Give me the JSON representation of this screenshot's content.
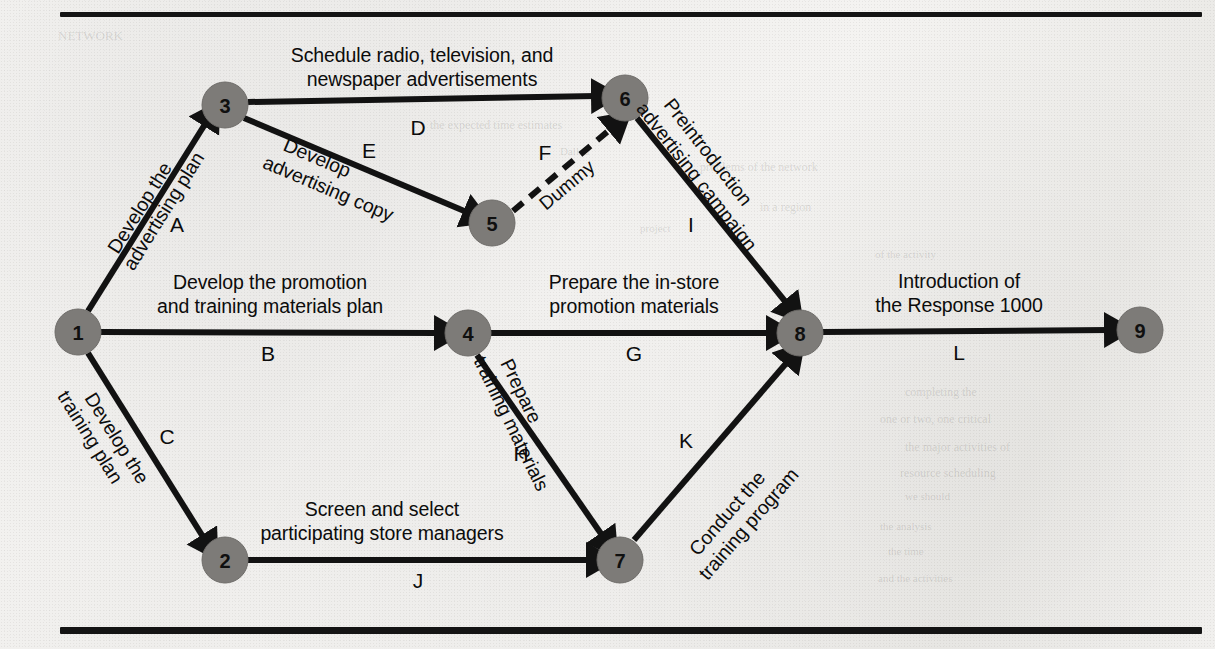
{
  "figure": {
    "type": "activity-on-arrow network diagram",
    "top_rule": true,
    "bottom_rule": true
  },
  "nodes": [
    {
      "id": "1",
      "label": "1",
      "cx": 78,
      "cy": 332,
      "r": 23
    },
    {
      "id": "2",
      "label": "2",
      "cx": 225,
      "cy": 560,
      "r": 23
    },
    {
      "id": "3",
      "label": "3",
      "cx": 225,
      "cy": 105,
      "r": 23
    },
    {
      "id": "4",
      "label": "4",
      "cx": 468,
      "cy": 333,
      "r": 23
    },
    {
      "id": "5",
      "label": "5",
      "cx": 492,
      "cy": 223,
      "r": 23
    },
    {
      "id": "6",
      "label": "6",
      "cx": 625,
      "cy": 98,
      "r": 23
    },
    {
      "id": "7",
      "label": "7",
      "cx": 620,
      "cy": 560,
      "r": 23
    },
    {
      "id": "8",
      "label": "8",
      "cx": 800,
      "cy": 333,
      "r": 23
    },
    {
      "id": "9",
      "label": "9",
      "cx": 1140,
      "cy": 330,
      "r": 23
    }
  ],
  "edges": [
    {
      "activity": "A",
      "from": "1",
      "to": "3",
      "style": "solid",
      "description": [
        "Develop the",
        "advertising plan"
      ]
    },
    {
      "activity": "B",
      "from": "1",
      "to": "4",
      "style": "solid",
      "description": [
        "Develop the promotion",
        "and training materials plan"
      ]
    },
    {
      "activity": "C",
      "from": "1",
      "to": "2",
      "style": "solid",
      "description": [
        "Develop the",
        "training plan"
      ]
    },
    {
      "activity": "D",
      "from": "3",
      "to": "6",
      "style": "solid",
      "description": [
        "Schedule radio, television, and",
        "newspaper advertisements"
      ]
    },
    {
      "activity": "E",
      "from": "3",
      "to": "5",
      "style": "solid",
      "description": [
        "Develop",
        "advertising copy"
      ]
    },
    {
      "activity": "F",
      "from": "5",
      "to": "6",
      "style": "dashed",
      "description": [
        "Dummy"
      ]
    },
    {
      "activity": "G",
      "from": "4",
      "to": "8",
      "style": "solid",
      "description": [
        "Prepare the in-store",
        "promotion materials"
      ]
    },
    {
      "activity": "H",
      "from": "4",
      "to": "7",
      "style": "solid",
      "description": [
        "Prepare",
        "training materials"
      ]
    },
    {
      "activity": "I",
      "from": "6",
      "to": "8",
      "style": "solid",
      "description": [
        "Preintroduction",
        "advertising campaign"
      ]
    },
    {
      "activity": "J",
      "from": "2",
      "to": "7",
      "style": "solid",
      "description": [
        "Screen and select",
        "participating store managers"
      ]
    },
    {
      "activity": "K",
      "from": "7",
      "to": "8",
      "style": "solid",
      "description": [
        "Conduct the",
        "training program"
      ]
    },
    {
      "activity": "L",
      "from": "8",
      "to": "9",
      "style": "solid",
      "description": [
        "Introduction of",
        "the Response 1000"
      ]
    }
  ],
  "labels": {
    "D_line1": "Schedule radio, television, and",
    "D_line2": "newspaper advertisements",
    "D_letter": "D",
    "A_line1": "Develop the",
    "A_line2": "advertising plan",
    "A_letter": "A",
    "E_line1": "Develop",
    "E_line2": "advertising copy",
    "E_letter": "E",
    "F_letter": "F",
    "F_word": "Dummy",
    "I_line1": "Preintroduction",
    "I_line2": "advertising campaign",
    "I_letter": "I",
    "B_line1": "Develop the promotion",
    "B_line2": "and training materials plan",
    "B_letter": "B",
    "G_line1": "Prepare the in-store",
    "G_line2": "promotion materials",
    "G_letter": "G",
    "L_line1": "Introduction of",
    "L_line2": "the Response 1000",
    "L_letter": "L",
    "C_line1": "Develop the",
    "C_line2": "training plan",
    "C_letter": "C",
    "H_line1": "Prepare",
    "H_line2": "training materials",
    "H_letter": "H",
    "K_line1": "Conduct the",
    "K_line2": "training program",
    "K_letter": "K",
    "J_line1": "Screen and select",
    "J_line2": "participating store managers",
    "J_letter": "J",
    "node1": "1",
    "node2": "2",
    "node3": "3",
    "node4": "4",
    "node5": "5",
    "node6": "6",
    "node7": "7",
    "node8": "8",
    "node9": "9"
  },
  "bleed_through": [
    {
      "text": "NETWORK",
      "x": 58,
      "y": 28,
      "size": 13,
      "rot": 0
    },
    {
      "text": "the expected time estimates",
      "x": 430,
      "y": 118,
      "size": 12,
      "rot": 0
    },
    {
      "text": "Dallad",
      "x": 560,
      "y": 145,
      "size": 11,
      "rot": 0
    },
    {
      "text": "problems of the network",
      "x": 700,
      "y": 160,
      "size": 12,
      "rot": 0
    },
    {
      "text": "in a region",
      "x": 760,
      "y": 200,
      "size": 12,
      "rot": 0
    },
    {
      "text": "project",
      "x": 640,
      "y": 222,
      "size": 11,
      "rot": 0
    },
    {
      "text": "of the activity",
      "x": 875,
      "y": 248,
      "size": 11,
      "rot": 0
    },
    {
      "text": "completing the",
      "x": 905,
      "y": 385,
      "size": 12,
      "rot": 0
    },
    {
      "text": "one or two, one critical",
      "x": 880,
      "y": 412,
      "size": 12,
      "rot": 0
    },
    {
      "text": "the major activities of",
      "x": 905,
      "y": 440,
      "size": 12,
      "rot": 0
    },
    {
      "text": "resource scheduling",
      "x": 900,
      "y": 466,
      "size": 12,
      "rot": 0
    },
    {
      "text": "we should",
      "x": 905,
      "y": 490,
      "size": 11,
      "rot": 0
    },
    {
      "text": "the analysis",
      "x": 880,
      "y": 520,
      "size": 11,
      "rot": 0
    },
    {
      "text": "the time",
      "x": 888,
      "y": 545,
      "size": 11,
      "rot": 0
    },
    {
      "text": "and the activities",
      "x": 878,
      "y": 572,
      "size": 11,
      "rot": 0
    }
  ],
  "colors": {
    "node_fill": "#7d7b78",
    "line": "#121212",
    "text": "#0c0c0c",
    "paper": "#f2f1ef"
  }
}
